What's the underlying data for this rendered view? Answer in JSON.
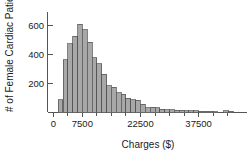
{
  "chart_data": {
    "type": "bar",
    "title": "",
    "subtitle": "",
    "xlabel": "Charges ($)",
    "ylabel": "# of Female Cardiac Patients",
    "grid": false,
    "legend": null,
    "xlim": [
      -1500,
      50000
    ],
    "ylim": [
      0,
      660
    ],
    "x_ticks": [
      0,
      7500,
      22500,
      37500
    ],
    "x_tick_labels": [
      "0",
      "7500",
      "22500",
      "37500"
    ],
    "x_minor_ticks": [
      0,
      3750,
      7500,
      11250,
      15000,
      18750,
      22500,
      26250,
      30000,
      33750,
      37500,
      41250,
      45000
    ],
    "y_ticks": [
      200,
      400,
      600
    ],
    "y_tick_labels": [
      "200",
      "600",
      "400"
    ],
    "y_tick_labels_ordered": [
      "200",
      "400",
      "600"
    ],
    "bin_width": 1250,
    "bin_starts": [
      1250,
      2500,
      3750,
      5000,
      6250,
      7500,
      8750,
      10000,
      11250,
      12500,
      13750,
      15000,
      16250,
      17500,
      18750,
      20000,
      21250,
      22500,
      23750,
      25000,
      26250,
      27500,
      28750,
      30000,
      31250,
      32500,
      33750,
      35000,
      36250,
      37500,
      38750,
      40000,
      41250,
      44000,
      45250
    ],
    "values": [
      85,
      345,
      450,
      500,
      580,
      545,
      460,
      360,
      320,
      250,
      175,
      165,
      130,
      120,
      95,
      85,
      80,
      55,
      30,
      35,
      32,
      20,
      18,
      17,
      15,
      14,
      13,
      12,
      10,
      9,
      8,
      7,
      5,
      10,
      9
    ],
    "bar_fill": "#a8a8a8",
    "bar_stroke": "#4d4d4d",
    "axis_color": "#555555",
    "text_color": "#1a1a1a"
  }
}
